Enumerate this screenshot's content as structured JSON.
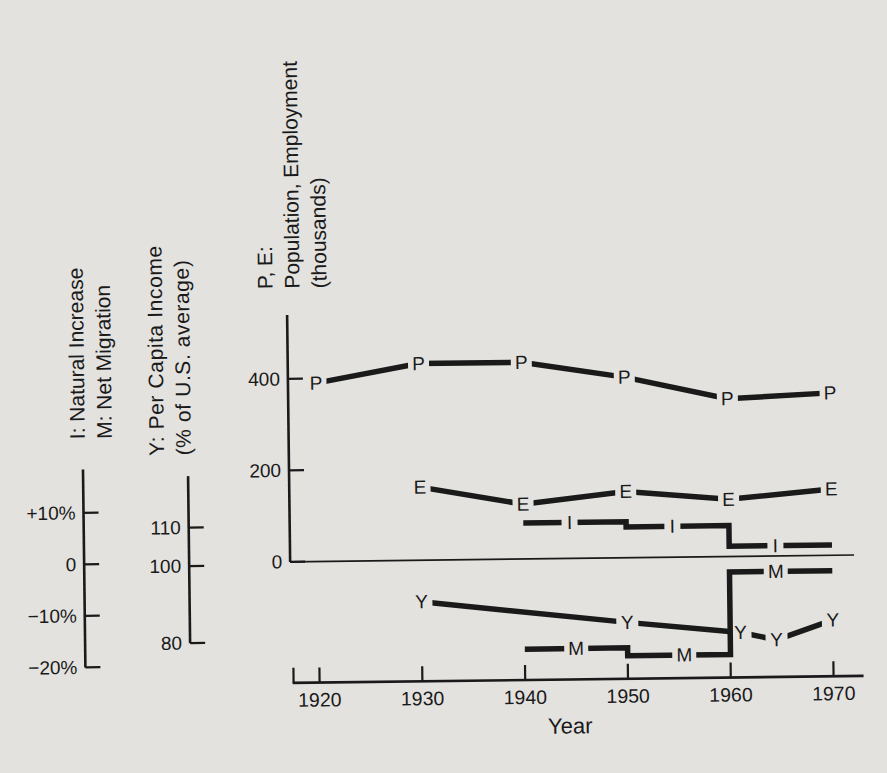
{
  "figure": {
    "background": "#e3e2df",
    "ink": "#1a1a1a"
  },
  "left_scales": {
    "im": {
      "label_lines": [
        "I: Natural Increase",
        "M: Net Migration"
      ],
      "ticks": [
        "+10%",
        "0",
        "−10%",
        "−20%"
      ],
      "tick_values": [
        10,
        0,
        -10,
        -20
      ]
    },
    "income": {
      "label_lines": [
        "Y: Per Capita Income",
        "(% of U.S. average)"
      ],
      "ticks": [
        "110",
        "100",
        "80"
      ],
      "tick_values": [
        110,
        100,
        80
      ]
    },
    "pe": {
      "label_lines": [
        "P, E:",
        "Population, Employment",
        "(thousands)"
      ],
      "ticks": [
        "400",
        "200",
        "0"
      ],
      "tick_values": [
        400,
        200,
        0
      ]
    }
  },
  "x_axis": {
    "label": "Year",
    "ticks": [
      "1920",
      "1930",
      "1940",
      "1950",
      "1960",
      "1970"
    ],
    "tick_values": [
      1920,
      1930,
      1940,
      1950,
      1960,
      1970
    ]
  },
  "chart_data": {
    "type": "line",
    "title": "",
    "xlabel": "Year",
    "x_range": [
      1917,
      1972
    ],
    "x_ticks": [
      1920,
      1930,
      1940,
      1950,
      1960,
      1970
    ],
    "grid": false,
    "legend": "series letters placed on lines",
    "axes": {
      "pe": {
        "label": "P, E: Population, Employment (thousands)",
        "ticks": [
          400,
          200,
          0
        ]
      },
      "pct": {
        "label": "I: Natural Increase, M: Net Migration (% per decade)",
        "ticks": [
          10,
          0,
          -10,
          -20
        ]
      },
      "inc": {
        "label": "Y: Per Capita Income (% of U.S. average)",
        "ticks": [
          110,
          100,
          80
        ]
      }
    },
    "series": [
      {
        "name": "P",
        "axis": "pe",
        "kind": "line",
        "points": [
          [
            1920,
            390
          ],
          [
            1930,
            430
          ],
          [
            1940,
            430
          ],
          [
            1950,
            395
          ],
          [
            1960,
            345
          ],
          [
            1970,
            355
          ]
        ]
      },
      {
        "name": "E",
        "axis": "pe",
        "kind": "line",
        "points": [
          [
            1930,
            160
          ],
          [
            1940,
            120
          ],
          [
            1950,
            145
          ],
          [
            1960,
            125
          ],
          [
            1970,
            145
          ]
        ]
      },
      {
        "name": "I",
        "axis": "pct",
        "kind": "step",
        "segments": [
          {
            "from": 1940,
            "to": 1950,
            "value": 7
          },
          {
            "from": 1950,
            "to": 1960,
            "value": 6
          },
          {
            "from": 1960,
            "to": 1970,
            "value": 2
          }
        ],
        "label_years": [
          1944.5,
          1954.5,
          1964.5
        ]
      },
      {
        "name": "Y",
        "axis": "inc",
        "kind": "line",
        "points": [
          [
            1930,
            90
          ],
          [
            1950,
            84
          ],
          [
            1961,
            81
          ],
          [
            1964.5,
            79
          ],
          [
            1970,
            84
          ]
        ]
      },
      {
        "name": "M",
        "axis": "pct",
        "kind": "step",
        "segments": [
          {
            "from": 1940,
            "to": 1950,
            "value": -17.5
          },
          {
            "from": 1950,
            "to": 1960,
            "value": -19
          },
          {
            "from": 1960,
            "to": 1970,
            "value": -3
          }
        ],
        "label_years": [
          1945,
          1955.5,
          1964.5
        ]
      }
    ]
  }
}
